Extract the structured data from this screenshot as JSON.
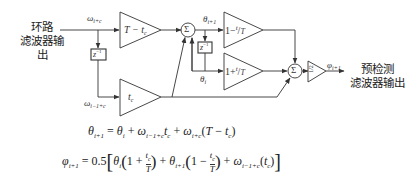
{
  "diagram": {
    "input_label_line1": "环路",
    "input_label_line2": "滤波器输出",
    "output_label_line1": "预检测",
    "output_label_line2": "滤波器输出",
    "signals": {
      "omega_in": "ω",
      "omega_in_sub": "i+c",
      "omega_delayed": "ω",
      "omega_delayed_sub": "i−1+c",
      "theta_next": "θ",
      "theta_next_sub": "i+1",
      "theta_cur": "θ",
      "theta_cur_sub": "i",
      "phi_out": "φ",
      "phi_out_sub": "i+1"
    },
    "blocks": {
      "gain_top": "T − t",
      "gain_top_sub": "c",
      "gain_bottom": "t",
      "gain_bottom_sub": "c",
      "gain_minus": "1−",
      "gain_minus_frac": "t",
      "gain_minus_frac_sub": "c",
      "gain_minus_den": "T",
      "gain_plus": "1+",
      "gain_plus_frac": "t",
      "gain_plus_frac_sub": "c",
      "gain_plus_den": "T",
      "gain_half": "1/2",
      "delay_1": "z",
      "delay_1_exp": "−1",
      "delay_2": "z",
      "delay_2_exp": "−1",
      "sum_1": "Σ",
      "sum_2": "Σ"
    },
    "equations": {
      "eq1": "θ_{i+1} = θ_i + ω_{i−1+c} t_c + ω_{i+c}(T − t_c)",
      "eq2": "φ_{i+1} = 0.5[θ_i(1 + t_c/T) + θ_{i+1}(1 − t_c/T) + ω_{i−1+c}(t_c)]"
    },
    "colors": {
      "line": "#333333",
      "background": "#ffffff"
    }
  }
}
